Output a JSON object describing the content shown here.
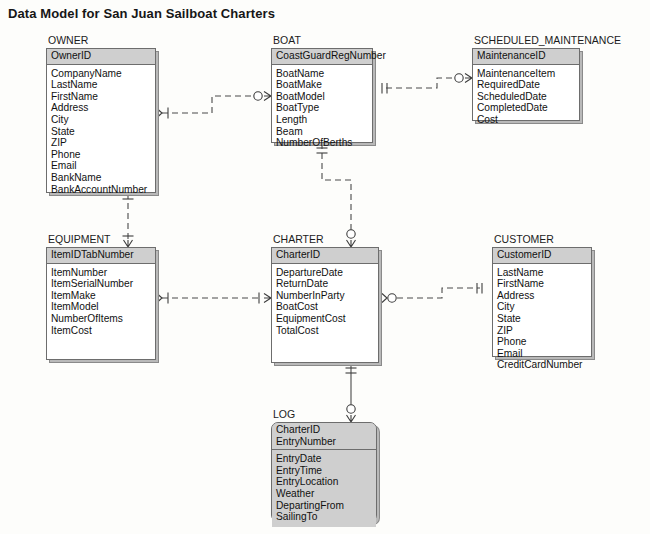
{
  "title": "Data Model for San Juan Sailboat Charters",
  "theme": {
    "key_fill": "#cfcfcf",
    "entity_fill": "#ffffff",
    "border": "#6d6d6d",
    "line": "#4a4a4a",
    "text": "#1b1b1b"
  },
  "entities": [
    {
      "id": "owner",
      "name": "OWNER",
      "weak": false,
      "x": 46,
      "y": 48,
      "w": 110,
      "keys": [
        "OwnerID"
      ],
      "attributes": [
        "CompanyName",
        "LastName",
        "FirstName",
        "Address",
        "City",
        "State",
        "ZIP",
        "Phone",
        "Email",
        "BankName",
        "BankAccountNumber"
      ]
    },
    {
      "id": "boat",
      "name": "BOAT",
      "weak": false,
      "x": 271,
      "y": 48,
      "w": 102,
      "keys": [
        "CoastGuardRegNumber"
      ],
      "attributes": [
        "BoatName",
        "BoatMake",
        "BoatModel",
        "BoatType",
        "Length",
        "Beam",
        "NumberOfBerths"
      ]
    },
    {
      "id": "scheduled_maintenance",
      "name": "SCHEDULED_MAINTENANCE",
      "weak": false,
      "x": 472,
      "y": 48,
      "w": 108,
      "keys": [
        "MaintenanceID"
      ],
      "attributes": [
        "MaintenanceItem",
        "RequiredDate",
        "ScheduledDate",
        "CompletedDate",
        "Cost"
      ]
    },
    {
      "id": "equipment",
      "name": "EQUIPMENT",
      "weak": false,
      "x": 46,
      "y": 247,
      "w": 110,
      "keys": [
        "ItemIDTabNumber"
      ],
      "attributes": [
        "ItemNumber",
        "ItemSerialNumber",
        "ItemMake",
        "ItemModel",
        "NumberOfItems",
        "ItemCost"
      ]
    },
    {
      "id": "charter",
      "name": "CHARTER",
      "weak": false,
      "x": 271,
      "y": 247,
      "w": 108,
      "keys": [
        "CharterID"
      ],
      "attributes": [
        "DepartureDate",
        "ReturnDate",
        "NumberInParty",
        "BoatCost",
        "EquipmentCost",
        "TotalCost"
      ]
    },
    {
      "id": "customer",
      "name": "CUSTOMER",
      "weak": false,
      "x": 492,
      "y": 247,
      "w": 100,
      "keys": [
        "CustomerID"
      ],
      "attributes": [
        "LastName",
        "FirstName",
        "Address",
        "City",
        "State",
        "ZIP",
        "Phone",
        "Email",
        "CreditCardNumber"
      ]
    },
    {
      "id": "log",
      "name": "LOG",
      "weak": true,
      "x": 271,
      "y": 422,
      "w": 106,
      "keys": [
        "CharterID",
        "EntryNumber"
      ],
      "attributes": [
        "EntryDate",
        "EntryTime",
        "EntryLocation",
        "Weather",
        "DepartingFrom",
        "SailingTo"
      ]
    }
  ],
  "relationships": [
    {
      "id": "owner-boat",
      "from": "OWNER",
      "to": "BOAT",
      "line_style": "dashed",
      "from_cardinality": "one-mandatory",
      "to_cardinality": "zero-or-many"
    },
    {
      "id": "boat-scheduled-maintenance",
      "from": "BOAT",
      "to": "SCHEDULED_MAINTENANCE",
      "line_style": "dashed",
      "from_cardinality": "one-and-only-one",
      "to_cardinality": "zero-or-many"
    },
    {
      "id": "owner-equipment",
      "from": "OWNER",
      "to": "EQUIPMENT",
      "line_style": "dashed",
      "from_cardinality": "one-and-only-one",
      "to_cardinality": "one-or-many"
    },
    {
      "id": "boat-charter",
      "from": "BOAT",
      "to": "CHARTER",
      "line_style": "dashed",
      "from_cardinality": "one-and-only-one",
      "to_cardinality": "zero-or-many"
    },
    {
      "id": "equipment-charter",
      "from": "EQUIPMENT",
      "to": "CHARTER",
      "line_style": "dashed",
      "from_cardinality": "one-mandatory",
      "to_cardinality": "one-or-many"
    },
    {
      "id": "charter-customer",
      "from": "CHARTER",
      "to": "CUSTOMER",
      "line_style": "dashed",
      "from_cardinality": "zero-or-one",
      "to_cardinality": "one-and-only-one"
    },
    {
      "id": "charter-log",
      "from": "CHARTER",
      "to": "LOG",
      "line_style": "solid",
      "from_cardinality": "one-and-only-one",
      "to_cardinality": "zero-or-many"
    }
  ]
}
